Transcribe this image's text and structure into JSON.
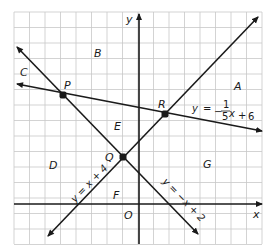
{
  "figure": {
    "axes": {
      "x_label": "x",
      "y_label": "y",
      "origin_label": "O"
    },
    "regions": [
      {
        "label": "A",
        "x": 238,
        "y": 90
      },
      {
        "label": "B",
        "x": 98,
        "y": 57
      },
      {
        "label": "C",
        "x": 24,
        "y": 76
      },
      {
        "label": "D",
        "x": 53,
        "y": 169
      },
      {
        "label": "E",
        "x": 118,
        "y": 130
      },
      {
        "label": "F",
        "x": 117,
        "y": 199
      },
      {
        "label": "G",
        "x": 207,
        "y": 168
      }
    ],
    "points": [
      {
        "label": "P",
        "px": 63,
        "py": 95,
        "lx": 68,
        "ly": 89
      },
      {
        "label": "Q",
        "px": 123,
        "py": 157,
        "lx": 109,
        "ly": 161
      },
      {
        "label": "R",
        "px": 165,
        "py": 114,
        "lx": 162,
        "ly": 108
      }
    ],
    "lines": [
      {
        "name": "y = x + 4",
        "equation": "y = x + 4",
        "x1": 48,
        "y1": 236,
        "x2": 258,
        "y2": 17,
        "label_x": 75,
        "label_y": 203,
        "label_rotate": -46
      },
      {
        "name": "y = -x + 2",
        "equation": "y = −x + 2",
        "x1": 17,
        "y1": 47,
        "x2": 198,
        "y2": 234,
        "label_x": 162,
        "label_y": 182,
        "label_rotate": 46
      },
      {
        "name": "y = -1/5 x + 6",
        "equation": "y = − 1/5 x + 6",
        "x1": 17,
        "y1": 84,
        "x2": 262,
        "y2": 131
      }
    ],
    "equation_third": {
      "lhs": "y",
      "eq": "=",
      "minus": "−",
      "num": "1",
      "den": "5",
      "var": "x",
      "plus": "+",
      "const": "6"
    },
    "colors": {
      "grid": "#c8c8c8",
      "ink": "#1a1a1a",
      "background": "#ffffff"
    }
  }
}
